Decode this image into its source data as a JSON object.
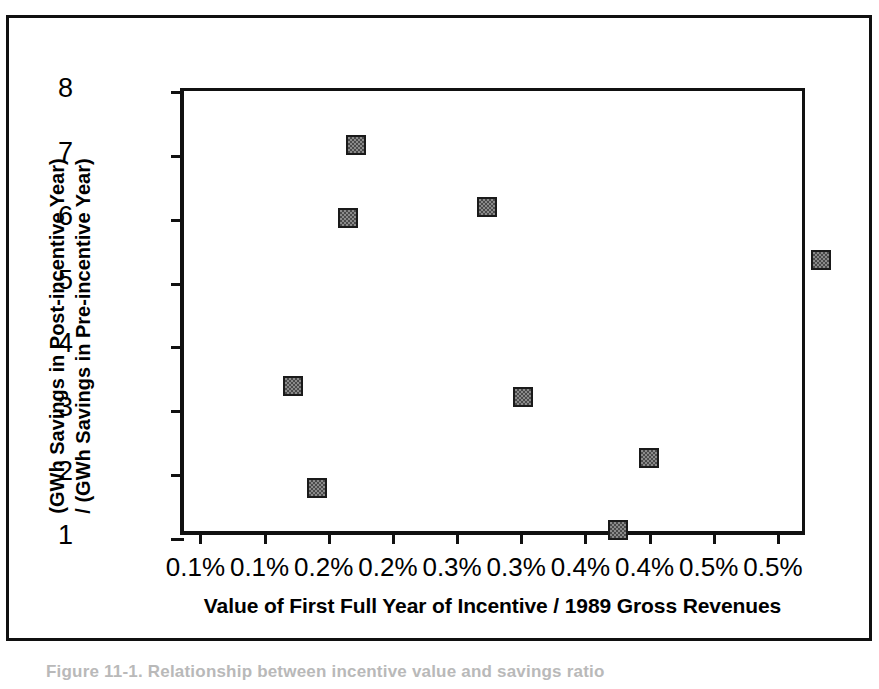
{
  "figure": {
    "caption_partial": "Figure 11-1. Relationship between incentive value and savings ratio"
  },
  "chart_data": {
    "type": "scatter",
    "title": "",
    "xlabel": "Value of First Full Year of Incentive / 1989 Gross Revenues",
    "ylabel_line1": "(GWh Savings in Post-incentive Year)",
    "ylabel_line2": "/ (GWh Savings in Pre-incentive Year)",
    "x_tick_labels": [
      "0.1%",
      "0.1%",
      "0.2%",
      "0.2%",
      "0.3%",
      "0.3%",
      "0.4%",
      "0.4%",
      "0.5%",
      "0.5%"
    ],
    "x_tick_values": [
      0.05,
      0.1,
      0.15,
      0.2,
      0.25,
      0.3,
      0.35,
      0.4,
      0.45,
      0.5
    ],
    "y_tick_labels": [
      "8",
      "7",
      "6",
      "5",
      "4",
      "3",
      "2",
      "1"
    ],
    "y_tick_values": [
      8,
      7,
      6,
      5,
      4,
      3,
      2,
      1
    ],
    "xlim": [
      0.038,
      0.525
    ],
    "ylim": [
      1,
      8
    ],
    "grid": false,
    "legend": false,
    "marker": {
      "shape": "square",
      "fill": "#8a8a8a",
      "pattern": "checker-dither",
      "edge": "#1a1a1a",
      "size_px": 20
    },
    "points": [
      {
        "x": 0.123,
        "y": 3.38
      },
      {
        "x": 0.142,
        "y": 1.78
      },
      {
        "x": 0.166,
        "y": 6.01
      },
      {
        "x": 0.172,
        "y": 7.15
      },
      {
        "x": 0.274,
        "y": 6.18
      },
      {
        "x": 0.302,
        "y": 3.21
      },
      {
        "x": 0.376,
        "y": 1.13
      },
      {
        "x": 0.4,
        "y": 2.25
      },
      {
        "x": 0.534,
        "y": 5.35
      }
    ]
  }
}
